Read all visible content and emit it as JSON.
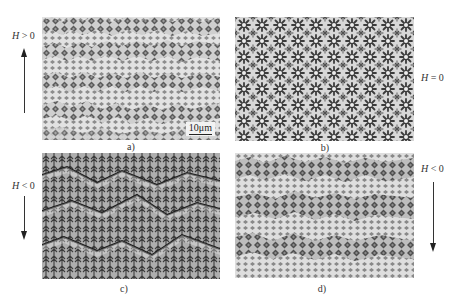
{
  "figure": {
    "panels": [
      {
        "id": "a",
        "caption": "a)",
        "field_label": "H > 0",
        "field_symbol": "H",
        "field_relation": " > 0",
        "arrow_direction": "up",
        "pattern": "stripe domains with diamond-shaped features (horizontal bands)",
        "scale_bar": "10μm"
      },
      {
        "id": "b",
        "caption": "b)",
        "field_label": "H = 0",
        "field_symbol": "H",
        "field_relation": " = 0",
        "arrow_direction": "none",
        "pattern": "isotropic star/dendritic domain network"
      },
      {
        "id": "c",
        "caption": "c)",
        "field_label": "H < 0",
        "field_symbol": "H",
        "field_relation": " < 0",
        "arrow_direction": "down",
        "pattern": "fir-tree / dendritic domains with zig-zag band boundaries"
      },
      {
        "id": "d",
        "caption": "d)",
        "field_label": "H < 0",
        "field_symbol": "H",
        "field_relation": " < 0",
        "arrow_direction": "down",
        "pattern": "stripe domains with diamond-shaped features (horizontal bands)"
      }
    ]
  }
}
